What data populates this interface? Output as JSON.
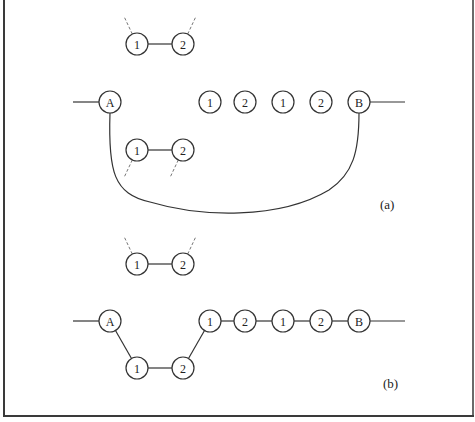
{
  "figure": {
    "panels": [
      {
        "id": "a",
        "label": "(a)",
        "nodes": [
          {
            "id": "a_t1",
            "text": "1",
            "role": "upper-pair-left"
          },
          {
            "id": "a_t2",
            "text": "2",
            "role": "upper-pair-right"
          },
          {
            "id": "a_A",
            "text": "A",
            "role": "endpoint-A"
          },
          {
            "id": "a_m1",
            "text": "1",
            "role": "chain-1"
          },
          {
            "id": "a_m2",
            "text": "2",
            "role": "chain-2"
          },
          {
            "id": "a_m3",
            "text": "1",
            "role": "chain-3"
          },
          {
            "id": "a_m4",
            "text": "2",
            "role": "chain-4"
          },
          {
            "id": "a_B",
            "text": "B",
            "role": "endpoint-B"
          },
          {
            "id": "a_b1",
            "text": "1",
            "role": "lower-pair-left"
          },
          {
            "id": "a_b2",
            "text": "2",
            "role": "lower-pair-right"
          }
        ],
        "edges": [
          {
            "from": "a_t1",
            "to": "a_t2",
            "style": "solid"
          },
          {
            "from": "a_b1",
            "to": "a_b2",
            "style": "solid"
          },
          {
            "from": "a_A",
            "to": "a_B",
            "style": "solid",
            "shape": "curve-below"
          },
          {
            "from": "external-left",
            "to": "a_A",
            "style": "solid"
          },
          {
            "from": "a_B",
            "to": "external-right",
            "style": "solid"
          },
          {
            "from": "a_t1",
            "to": "dangling-up-left",
            "style": "dashed"
          },
          {
            "from": "a_t2",
            "to": "dangling-up-right",
            "style": "dashed"
          },
          {
            "from": "a_b1",
            "to": "dangling-down-left",
            "style": "dashed"
          },
          {
            "from": "a_b2",
            "to": "dangling-down-left",
            "style": "dashed"
          }
        ]
      },
      {
        "id": "b",
        "label": "(b)",
        "nodes": [
          {
            "id": "b_t1",
            "text": "1",
            "role": "upper-pair-left"
          },
          {
            "id": "b_t2",
            "text": "2",
            "role": "upper-pair-right"
          },
          {
            "id": "b_A",
            "text": "A",
            "role": "endpoint-A"
          },
          {
            "id": "b_m1",
            "text": "1",
            "role": "chain-1"
          },
          {
            "id": "b_m2",
            "text": "2",
            "role": "chain-2"
          },
          {
            "id": "b_m3",
            "text": "1",
            "role": "chain-3"
          },
          {
            "id": "b_m4",
            "text": "2",
            "role": "chain-4"
          },
          {
            "id": "b_B",
            "text": "B",
            "role": "endpoint-B"
          },
          {
            "id": "b_b1",
            "text": "1",
            "role": "lower-pair-left"
          },
          {
            "id": "b_b2",
            "text": "2",
            "role": "lower-pair-right"
          }
        ],
        "edges": [
          {
            "from": "b_t1",
            "to": "b_t2",
            "style": "solid"
          },
          {
            "from": "external-left",
            "to": "b_A",
            "style": "solid"
          },
          {
            "from": "b_A",
            "to": "b_b1",
            "style": "solid"
          },
          {
            "from": "b_b1",
            "to": "b_b2",
            "style": "solid"
          },
          {
            "from": "b_b2",
            "to": "b_m1",
            "style": "solid"
          },
          {
            "from": "b_m1",
            "to": "b_m2",
            "style": "solid"
          },
          {
            "from": "b_m2",
            "to": "b_m3",
            "style": "solid"
          },
          {
            "from": "b_m3",
            "to": "b_m4",
            "style": "solid"
          },
          {
            "from": "b_m4",
            "to": "b_B",
            "style": "solid"
          },
          {
            "from": "b_B",
            "to": "external-right",
            "style": "solid"
          },
          {
            "from": "b_t1",
            "to": "dangling-up-left",
            "style": "dashed"
          },
          {
            "from": "b_t2",
            "to": "dangling-up-right",
            "style": "dashed"
          }
        ]
      }
    ],
    "colors": {
      "ink": "#333333",
      "dashed": "#777777",
      "background": "#ffffff"
    }
  }
}
